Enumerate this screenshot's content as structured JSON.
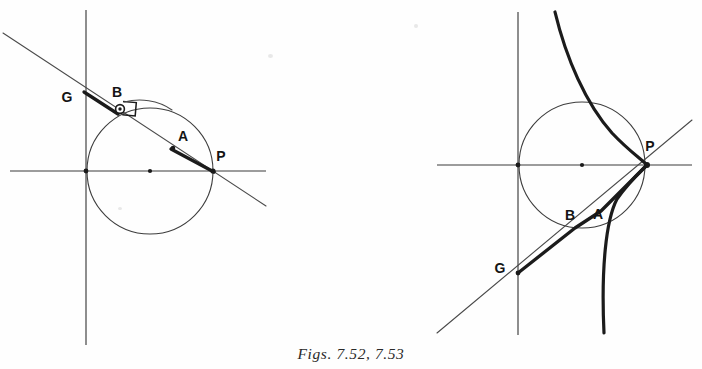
{
  "page": {
    "kind": "textbook-figure-pair",
    "background_color": "#fefefe",
    "ink_color": "#1a1a1a",
    "width": 702,
    "height": 369
  },
  "caption": {
    "text": "Figs. 7.52, 7.53",
    "style": "italic-serif"
  },
  "figures": [
    {
      "id": "fig-7-52",
      "name": "left-figure",
      "description": "Circle with horizontal and vertical axes and a straight secant line through points G, B, A, P",
      "circle": {
        "cx": 150,
        "cy": 171,
        "r": 63
      },
      "axes": {
        "vertical": {
          "x": 86,
          "y1": 10,
          "y2": 345
        },
        "horizontal": {
          "y": 171,
          "x1": 10,
          "x2": 266
        }
      },
      "secant_line": {
        "from_x": 3,
        "from_y": 33,
        "to_x": 266,
        "to_y": 206
      },
      "bold_segment": {
        "from": "G",
        "to": "P"
      },
      "center_dot": {
        "x": 150,
        "y": 171
      },
      "right_angle_marker_at": "B",
      "points": [
        {
          "name": "G",
          "label": "G",
          "x": 86,
          "y": 93,
          "label_x": 67,
          "label_y": 102,
          "marker": "none"
        },
        {
          "name": "B",
          "label": "B",
          "x": 117,
          "y": 105,
          "label_x": 117,
          "label_y": 97,
          "marker": "ring"
        },
        {
          "name": "A",
          "label": "A",
          "x": 173,
          "y": 148,
          "label_x": 183,
          "label_y": 141,
          "marker": "dot"
        },
        {
          "name": "P",
          "label": "P",
          "x": 213,
          "y": 171,
          "label_x": 221,
          "label_y": 161,
          "marker": "none"
        }
      ]
    },
    {
      "id": "fig-7-53",
      "name": "right-figure",
      "description": "Circle with axes, a straight line through G, B, A, P and a bold cubic curve crossing at P",
      "circle": {
        "cx": 582,
        "cy": 165,
        "r": 63
      },
      "axes": {
        "vertical": {
          "x": 518,
          "y1": 12,
          "y2": 335
        },
        "horizontal": {
          "y": 165,
          "x1": 437,
          "x2": 692
        }
      },
      "secant_line": {
        "from_x": 437,
        "from_y": 333,
        "to_x": 692,
        "to_y": 120
      },
      "bold_segment": {
        "from": "G",
        "to": "P"
      },
      "center_dot": {
        "x": 582,
        "y": 165
      },
      "points": [
        {
          "name": "G",
          "label": "G",
          "x": 518,
          "y": 273,
          "label_x": 500,
          "label_y": 273,
          "marker": "none"
        },
        {
          "name": "B",
          "label": "B",
          "x": 578,
          "y": 226,
          "label_x": 570,
          "label_y": 220,
          "marker": "none"
        },
        {
          "name": "A",
          "label": "A",
          "x": 601,
          "y": 212,
          "label_x": 598,
          "label_y": 219,
          "marker": "none"
        },
        {
          "name": "P",
          "label": "P",
          "x": 647,
          "y": 165,
          "label_x": 650,
          "label_y": 151,
          "marker": "none"
        }
      ],
      "cubic_curve": {
        "description": "bold S-shaped curve entering top, passing through P, exiting bottom",
        "top_x": 555,
        "top_y": 12,
        "through_x": 647,
        "through_y": 165,
        "bottom_x": 604,
        "bottom_y": 333
      }
    }
  ]
}
